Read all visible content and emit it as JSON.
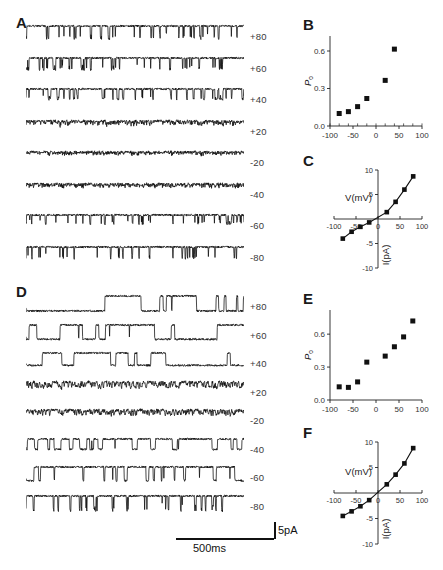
{
  "figure": {
    "caption_panels": [
      "A",
      "B",
      "C",
      "D",
      "E",
      "F"
    ]
  },
  "panels": {
    "A": {
      "letter": "A",
      "kind": "single-channel-traces",
      "description": "Representative single-channel current traces at eight holding potentials, low open probability",
      "voltage_labels": [
        "+80",
        "+60",
        "+40",
        "+20",
        "-20",
        "-40",
        "-60",
        "-80"
      ]
    },
    "B": {
      "letter": "B",
      "kind": "scatter"
    },
    "C": {
      "letter": "C",
      "kind": "iv-curve"
    },
    "D": {
      "letter": "D",
      "kind": "single-channel-traces",
      "description": "Representative single-channel current traces at eight holding potentials, high open probability",
      "voltage_labels": [
        "+80",
        "+60",
        "+40",
        "+20",
        "-20",
        "-40",
        "-60",
        "-80"
      ]
    },
    "E": {
      "letter": "E",
      "kind": "scatter"
    },
    "F": {
      "letter": "F",
      "kind": "iv-curve"
    }
  },
  "scalebar": {
    "vertical_label": "5pA",
    "horizontal_label": "500ms"
  },
  "chart_data": [
    {
      "id": "B",
      "type": "scatter",
      "title": "B",
      "xlabel": "",
      "ylabel": "Po",
      "ylabel_sub": "o",
      "xlim": [
        -100,
        100
      ],
      "ylim": [
        0.0,
        0.72
      ],
      "xticks": [
        -100,
        -50,
        0,
        50,
        100
      ],
      "xtick_labels": [
        "-100",
        "-50",
        "0",
        "50",
        "100"
      ],
      "yticks": [
        0.0,
        0.3,
        0.6
      ],
      "ytick_labels": [
        "0.0",
        "0.3",
        "0.6"
      ],
      "minor_xticks": [
        -100,
        -80,
        -60,
        -40,
        -20,
        0,
        20,
        40,
        60,
        80,
        100
      ],
      "grid": false,
      "legend": "none",
      "marker": "filled-square",
      "x": [
        -80,
        -60,
        -40,
        -20,
        20,
        40
      ],
      "y": [
        0.1,
        0.115,
        0.155,
        0.22,
        0.365,
        0.615
      ]
    },
    {
      "id": "C",
      "type": "scatter",
      "title": "C",
      "xlabel": "V(mV)",
      "ylabel": "I(pA)",
      "xlim": [
        -100,
        100
      ],
      "ylim": [
        -10,
        10
      ],
      "xticks": [
        -100,
        -50,
        0,
        50,
        100
      ],
      "xtick_labels": [
        "-100",
        "-50",
        "0",
        "50",
        "100"
      ],
      "yticks": [
        -10,
        -5,
        0,
        5,
        10
      ],
      "ytick_labels": [
        "-10",
        "-5",
        "0",
        "5",
        "10"
      ],
      "grid": false,
      "legend": "none",
      "marker": "filled-square",
      "fit_line": true,
      "x": [
        -80,
        -60,
        -40,
        -20,
        20,
        40,
        60,
        80
      ],
      "y": [
        -4.0,
        -2.6,
        -1.6,
        -0.7,
        1.4,
        3.5,
        6.0,
        8.7
      ]
    },
    {
      "id": "E",
      "type": "scatter",
      "title": "E",
      "xlabel": "",
      "ylabel": "Po",
      "ylabel_sub": "o",
      "xlim": [
        -100,
        100
      ],
      "ylim": [
        0.0,
        0.82
      ],
      "xticks": [
        -100,
        -50,
        0,
        50,
        100
      ],
      "xtick_labels": [
        "-100",
        "-50",
        "0",
        "50",
        "100"
      ],
      "yticks": [
        0.0,
        0.3,
        0.6
      ],
      "ytick_labels": [
        "0.0",
        "0.3",
        "0.6"
      ],
      "grid": false,
      "legend": "none",
      "marker": "filled-square",
      "x": [
        -80,
        -60,
        -40,
        -20,
        20,
        40,
        60,
        80
      ],
      "y": [
        0.12,
        0.115,
        0.165,
        0.345,
        0.4,
        0.485,
        0.575,
        0.72
      ]
    },
    {
      "id": "F",
      "type": "scatter",
      "title": "F",
      "xlabel": "V(mV)",
      "ylabel": "I(pA)",
      "xlim": [
        -100,
        100
      ],
      "ylim": [
        -10,
        10
      ],
      "xticks": [
        -100,
        -50,
        0,
        50,
        100
      ],
      "xtick_labels": [
        "-100",
        "-50",
        "0",
        "50",
        "100"
      ],
      "yticks": [
        -10,
        -5,
        0,
        5,
        10
      ],
      "ytick_labels": [
        "-10",
        "-5",
        "0",
        "5",
        "10"
      ],
      "grid": false,
      "legend": "none",
      "marker": "filled-square",
      "fit_line": true,
      "x": [
        -80,
        -60,
        -40,
        -20,
        20,
        40,
        60,
        80
      ],
      "y": [
        -4.5,
        -3.6,
        -2.6,
        -1.4,
        1.7,
        3.6,
        5.8,
        8.8
      ]
    }
  ],
  "traces": {
    "A": {
      "rows": [
        {
          "voltage": "+80",
          "open_prob": 0.1,
          "amp": 1.0,
          "polarity": -1,
          "style": "spiky",
          "seed": 11
        },
        {
          "voltage": "+60",
          "open_prob": 0.12,
          "amp": 0.92,
          "polarity": -1,
          "style": "spiky",
          "seed": 23
        },
        {
          "voltage": "+40",
          "open_prob": 0.16,
          "amp": 0.8,
          "polarity": -1,
          "style": "spiky",
          "seed": 37
        },
        {
          "voltage": "+20",
          "open_prob": 0.22,
          "amp": 0.42,
          "polarity": -1,
          "style": "fuzzy",
          "seed": 51
        },
        {
          "voltage": "-20",
          "open_prob": 0.18,
          "amp": 0.34,
          "polarity": -1,
          "style": "fuzzy",
          "seed": 67
        },
        {
          "voltage": "-40",
          "open_prob": 0.16,
          "amp": 0.4,
          "polarity": -1,
          "style": "fuzzy",
          "seed": 83
        },
        {
          "voltage": "-60",
          "open_prob": 0.12,
          "amp": 0.7,
          "polarity": -1,
          "style": "spiky",
          "seed": 97
        },
        {
          "voltage": "-80",
          "open_prob": 0.1,
          "amp": 0.95,
          "polarity": -1,
          "style": "spiky",
          "seed": 113
        }
      ]
    },
    "D": {
      "rows": [
        {
          "voltage": "+80",
          "open_prob": 0.72,
          "amp": 1.15,
          "polarity": -1,
          "style": "square",
          "seed": 7
        },
        {
          "voltage": "+60",
          "open_prob": 0.62,
          "amp": 1.1,
          "polarity": -1,
          "style": "square",
          "seed": 19
        },
        {
          "voltage": "+40",
          "open_prob": 0.52,
          "amp": 0.95,
          "polarity": -1,
          "style": "square",
          "seed": 31
        },
        {
          "voltage": "+20",
          "open_prob": 0.4,
          "amp": 0.5,
          "polarity": -1,
          "style": "fuzzy",
          "seed": 43
        },
        {
          "voltage": "-20",
          "open_prob": 0.34,
          "amp": 0.45,
          "polarity": -1,
          "style": "fuzzy",
          "seed": 59
        },
        {
          "voltage": "-40",
          "open_prob": 0.3,
          "amp": 0.8,
          "polarity": -1,
          "style": "square",
          "seed": 71
        },
        {
          "voltage": "-60",
          "open_prob": 0.22,
          "amp": 1.05,
          "polarity": -1,
          "style": "square",
          "seed": 89
        },
        {
          "voltage": "-80",
          "open_prob": 0.14,
          "amp": 1.15,
          "polarity": -1,
          "style": "spiky",
          "seed": 101
        }
      ]
    }
  }
}
